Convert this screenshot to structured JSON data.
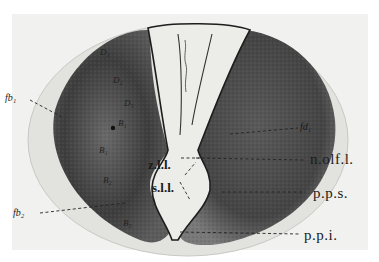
{
  "figure": {
    "background_color": "#ffffff",
    "section_tissue_color": "#4a4a4a",
    "ventricle_color": "#ecece8",
    "labels": {
      "fb1": "fb₁",
      "fb2": "fb₂",
      "fd1": "fd₁",
      "D1": "D₁",
      "D2": "D₂",
      "D3": "D₃",
      "B1": "B₁",
      "B1b": "B₁",
      "B2": "B₂",
      "B3": "B₃",
      "zll": "z.l.l.",
      "sll": "s.l.l.",
      "n_olf_l": "n.olf.l.",
      "pps": "p.p.s.",
      "ppi": "p.p.i."
    }
  }
}
